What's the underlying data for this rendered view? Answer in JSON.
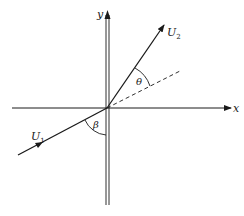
{
  "diagram": {
    "axes": {
      "x_label": "x",
      "y_label": "y"
    },
    "vectors": {
      "u1_label": "U",
      "u1_sub": "1",
      "u2_label": "U",
      "u2_sub": "2"
    },
    "angles": {
      "theta": "θ",
      "beta": "β"
    },
    "colors": {
      "line": "#1a1a1a",
      "background": "#ffffff"
    }
  }
}
